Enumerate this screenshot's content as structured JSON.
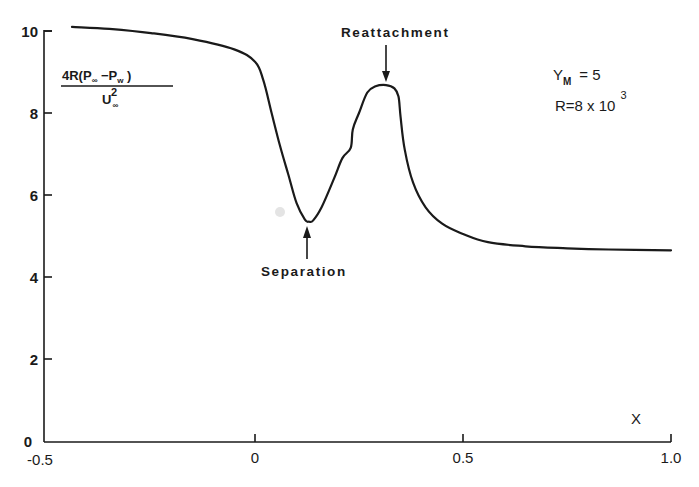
{
  "chart_data": {
    "type": "line",
    "title": "",
    "xlabel": "X",
    "ylabel": "4R(P∞ − Pw) / U∞²",
    "ylabel_parts": {
      "numerator": "4R(P",
      "num_sub1": "∞",
      "num_mid": " −P",
      "num_sub2": "w",
      "num_end": " )",
      "denominator": "U",
      "den_sup": "2",
      "den_sub": "∞"
    },
    "xlim": [
      -0.5,
      1.0
    ],
    "ylim": [
      0,
      10
    ],
    "xticks": [
      -0.5,
      0,
      0.5,
      1.0
    ],
    "xtick_labels": [
      "-0.5",
      "0",
      "0.5",
      "1.0"
    ],
    "yticks": [
      0,
      2,
      4,
      6,
      8,
      10
    ],
    "ytick_labels": [
      "0",
      "2",
      "4",
      "6",
      "8",
      "10"
    ],
    "grid": false,
    "legend": null,
    "parameters": {
      "ym_label": "Y",
      "ym_sub": "M",
      "ym_value": "= 5",
      "r_label": "R=8 x 10",
      "r_exp": "3"
    },
    "annotations": [
      {
        "text": "Reattachment",
        "x": 0.315,
        "y": 8.68,
        "arrow": "down"
      },
      {
        "text": "Separation",
        "x": 0.13,
        "y": 5.35,
        "arrow": "up"
      }
    ],
    "series": [
      {
        "name": "pressure",
        "x": [
          -0.44,
          -0.35,
          -0.25,
          -0.15,
          -0.05,
          0.0,
          0.02,
          0.04,
          0.06,
          0.08,
          0.1,
          0.12,
          0.13,
          0.14,
          0.16,
          0.19,
          0.21,
          0.23,
          0.235,
          0.25,
          0.27,
          0.29,
          0.315,
          0.335,
          0.345,
          0.35,
          0.36,
          0.38,
          0.41,
          0.45,
          0.5,
          0.56,
          0.65,
          0.75,
          0.85,
          1.0
        ],
        "values": [
          10.1,
          10.05,
          9.95,
          9.8,
          9.55,
          9.25,
          8.8,
          8.0,
          7.2,
          6.5,
          5.8,
          5.4,
          5.35,
          5.38,
          5.7,
          6.4,
          6.9,
          7.15,
          7.6,
          8.0,
          8.5,
          8.65,
          8.68,
          8.6,
          8.4,
          7.9,
          7.1,
          6.3,
          5.7,
          5.3,
          5.05,
          4.85,
          4.75,
          4.7,
          4.67,
          4.65
        ]
      }
    ]
  }
}
